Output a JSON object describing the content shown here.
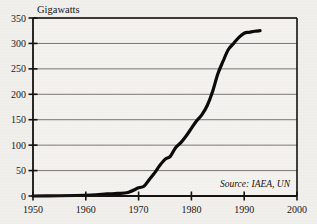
{
  "chart_data": {
    "type": "line",
    "title": "",
    "subtitle": "",
    "xlabel": "",
    "ylabel": "Gigawatts",
    "xlim": [
      1950,
      2000
    ],
    "ylim": [
      0,
      350
    ],
    "grid": true,
    "legend": false,
    "annotations": [
      {
        "text": "Source: IAEA, UN",
        "x": 1985,
        "y": 22,
        "style": "italic"
      }
    ],
    "xticks": [
      1950,
      1960,
      1970,
      1980,
      1990,
      2000
    ],
    "xtick_labels": [
      "1950",
      "1960",
      "1970",
      "1980",
      "1990",
      "2000"
    ],
    "yticks": [
      0,
      50,
      100,
      150,
      200,
      250,
      300,
      350
    ],
    "ytick_labels": [
      "0",
      "50",
      "100",
      "150",
      "200",
      "250",
      "300",
      "350"
    ],
    "series": [
      {
        "name": "World nuclear generating capacity",
        "color": "#0d0b0a",
        "line_width": 3.2,
        "x": [
          1950,
          1955,
          1958,
          1960,
          1962,
          1964,
          1966,
          1968,
          1970,
          1971,
          1972,
          1973,
          1974,
          1975,
          1976,
          1977,
          1978,
          1979,
          1980,
          1981,
          1982,
          1983,
          1984,
          1985,
          1986,
          1987,
          1988,
          1989,
          1990,
          1991,
          1992,
          1993
        ],
        "values": [
          0,
          0.5,
          1,
          1.5,
          2.5,
          4,
          5,
          7,
          16,
          19,
          32,
          45,
          60,
          72,
          78,
          95,
          105,
          118,
          133,
          148,
          160,
          178,
          205,
          240,
          265,
          288,
          300,
          312,
          320,
          322,
          324,
          325
        ]
      }
    ]
  },
  "axes": {
    "y_axis_title": "Gigawatts"
  }
}
